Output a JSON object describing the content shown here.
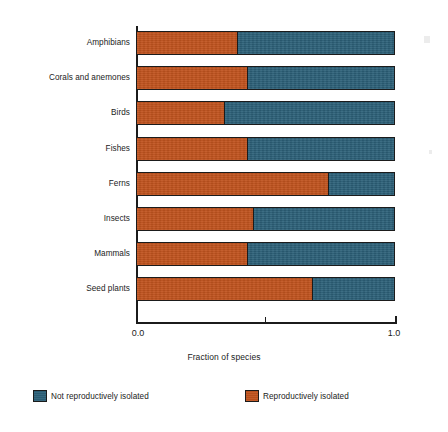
{
  "chart_data": {
    "type": "bar",
    "orientation": "horizontal",
    "stacked": true,
    "normalized": true,
    "title": "",
    "xlabel": "Fraction of species",
    "ylabel": "",
    "xlim": [
      0.0,
      1.0
    ],
    "xticks": [
      0.0,
      0.5,
      1.0
    ],
    "xticklabels": [
      "0.0",
      "",
      "1.0"
    ],
    "grid": false,
    "legend_position": "below-axes",
    "categories": [
      "Amphibians",
      "Corals and anemones",
      "Birds",
      "Fishes",
      "Ferns",
      "Insects",
      "Mammals",
      "Seed plants"
    ],
    "series": [
      {
        "name": "Reproductively isolated",
        "color": "#c0531e",
        "values": [
          0.39,
          0.43,
          0.34,
          0.43,
          0.74,
          0.45,
          0.43,
          0.68
        ]
      },
      {
        "name": "Not reproductively isolated",
        "color": "#2c6078",
        "values": [
          0.61,
          0.57,
          0.66,
          0.57,
          0.26,
          0.55,
          0.57,
          0.32
        ]
      }
    ]
  },
  "axis": {
    "x_title": "Fraction of species",
    "tick_labels": {
      "min": "0.0",
      "max": "1.0"
    }
  },
  "legend": {
    "items": [
      {
        "label": "Not reproductively isolated",
        "color": "#2c6078"
      },
      {
        "label": "Reproductively isolated",
        "color": "#c0531e"
      }
    ]
  },
  "colors": {
    "isolated": "#c0531e",
    "not_isolated": "#2c6078",
    "axis": "#1b1b1b",
    "background": "#ffffff"
  }
}
